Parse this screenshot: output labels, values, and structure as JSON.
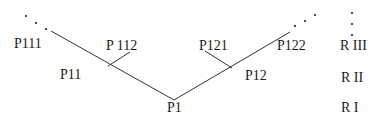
{
  "diagram": {
    "nodes": {
      "p111": "P111",
      "p112": "P 112",
      "p11": "P11",
      "p1": "P1",
      "p121": "P121",
      "p122": "P122",
      "p12": "P12"
    },
    "levels": {
      "r3": "R III",
      "r2": "R II",
      "r1": "R I"
    },
    "line_color": "#333333"
  }
}
